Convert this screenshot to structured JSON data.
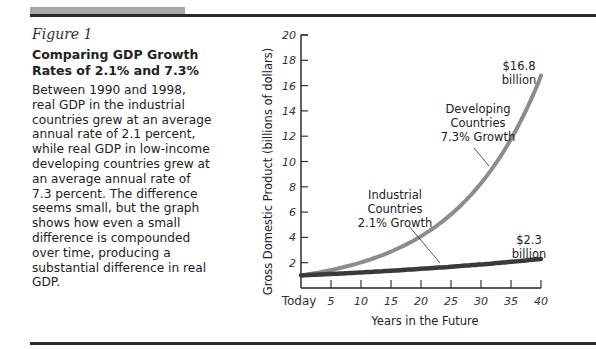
{
  "figure": {
    "label": "Figure 1",
    "title": "Comparing GDP Growth Rates of 2.1% and 7.3%",
    "caption": "Between 1990 and 1998, real GDP in the industrial countries grew at an average annual rate of 2.1 percent, while real GDP in low-income developing countries grew at an average annual rate of 7.3 percent. The difference seems small, but the graph shows how even a small difference is compounded over time, producing a substantial difference in real GDP."
  },
  "chart_data": {
    "type": "line",
    "title": "Comparing GDP Growth Rates of 2.1% and 7.3%",
    "xlabel": "Years in the Future",
    "ylabel": "Gross Domestic Product (billions of dollars)",
    "x_tick_labels": [
      "Today",
      "5",
      "10",
      "15",
      "20",
      "25",
      "30",
      "35",
      "40"
    ],
    "y_tick_labels": [
      "2",
      "4",
      "6",
      "8",
      "10",
      "12",
      "14",
      "16",
      "18",
      "20"
    ],
    "xlim": [
      0,
      40
    ],
    "ylim": [
      0,
      20
    ],
    "grid": false,
    "x": [
      0,
      5,
      10,
      15,
      20,
      25,
      30,
      35,
      40
    ],
    "series": [
      {
        "name": "Developing Countries 7.3% Growth",
        "color": "#8c8c8c",
        "values": [
          1.0,
          1.42,
          2.02,
          2.87,
          4.08,
          5.8,
          8.25,
          11.73,
          16.8
        ]
      },
      {
        "name": "Industrial Countries 2.1% Growth",
        "color": "#3a3a3a",
        "values": [
          1.0,
          1.11,
          1.23,
          1.37,
          1.52,
          1.68,
          1.87,
          2.07,
          2.3
        ]
      }
    ],
    "annotations": [
      {
        "text_lines": [
          "$16.8",
          "billion"
        ],
        "target": "Developing end value"
      },
      {
        "text_lines": [
          "$2.3",
          "billion"
        ],
        "target": "Industrial end value"
      },
      {
        "text_lines": [
          "Developing",
          "Countries",
          "7.3% Growth"
        ],
        "target": "Developing curve"
      },
      {
        "text_lines": [
          "Industrial",
          "Countries",
          "2.1% Growth"
        ],
        "target": "Industrial curve"
      }
    ]
  }
}
